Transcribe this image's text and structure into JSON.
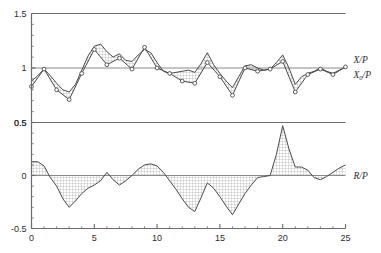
{
  "chart_data": {
    "type": "line",
    "title": "",
    "subtitle": "",
    "xlabel": "",
    "ylabel": "",
    "grid": false,
    "legend_position": "right",
    "panels": [
      {
        "name": "upper",
        "ylim": [
          0.5,
          1.5
        ],
        "yticks": [
          0.5,
          1.0,
          1.5
        ],
        "ytick_labels": [
          "0.5",
          "1",
          "1.5"
        ],
        "reference_line": 1.0,
        "xlim": [
          0,
          25
        ],
        "series": [
          {
            "name": "X/P",
            "marker": "none",
            "x": [
              0,
              0.5,
              1,
              1.5,
              2,
              2.5,
              3,
              3.5,
              4,
              4.5,
              5,
              5.5,
              6,
              6.5,
              7,
              7.5,
              8,
              8.5,
              9,
              9.5,
              10,
              10.5,
              11,
              11.5,
              12,
              12.5,
              13,
              13.5,
              14,
              14.5,
              15,
              15.5,
              16,
              16.5,
              17,
              17.5,
              18,
              18.5,
              19,
              19.5,
              20,
              20.5,
              21,
              21.5,
              22,
              22.5,
              23,
              23.5,
              24,
              24.5,
              25
            ],
            "values": [
              0.88,
              0.93,
              0.99,
              0.93,
              0.86,
              0.8,
              0.78,
              0.85,
              0.98,
              1.11,
              1.2,
              1.22,
              1.15,
              1.1,
              1.13,
              1.07,
              1.06,
              1.12,
              1.17,
              1.14,
              1.05,
              0.97,
              0.95,
              0.96,
              0.97,
              0.98,
              0.96,
              1.04,
              1.14,
              1.03,
              0.95,
              0.88,
              0.82,
              0.92,
              1.02,
              1.03,
              1.0,
              0.98,
              0.99,
              1.05,
              1.12,
              1.0,
              0.85,
              0.92,
              0.95,
              0.97,
              1.0,
              0.97,
              0.95,
              0.98,
              1.01
            ]
          },
          {
            "name": "X0/P",
            "marker": "circle",
            "x": [
              0,
              1,
              2,
              3,
              4,
              5,
              6,
              7,
              8,
              9,
              10,
              11,
              12,
              13,
              14,
              15,
              16,
              17,
              18,
              19,
              20,
              21,
              22,
              23,
              24,
              25
            ],
            "values": [
              0.83,
              0.99,
              0.8,
              0.71,
              0.95,
              1.17,
              1.03,
              1.09,
              0.99,
              1.19,
              1.0,
              0.95,
              0.88,
              0.86,
              1.05,
              0.92,
              0.75,
              1.0,
              0.97,
              0.99,
              1.06,
              0.78,
              0.94,
              0.99,
              0.94,
              1.01
            ]
          }
        ],
        "legend": [
          {
            "label": "X/P",
            "sub": ""
          },
          {
            "label": "X",
            "sub": "0",
            "suffix": "/P"
          }
        ]
      },
      {
        "name": "lower",
        "ylim": [
          -0.5,
          0.5
        ],
        "yticks": [
          -0.5,
          0.0,
          0.5
        ],
        "ytick_labels": [
          "-0.5",
          "0",
          "0.5"
        ],
        "reference_line": 0.0,
        "xlim": [
          0,
          25
        ],
        "series": [
          {
            "name": "R/P",
            "marker": "none",
            "fill": "crosshatch",
            "x": [
              0,
              0.5,
              1,
              1.5,
              2,
              2.5,
              3,
              3.5,
              4,
              4.5,
              5,
              5.5,
              6,
              6.5,
              7,
              7.5,
              8,
              8.5,
              9,
              9.5,
              10,
              10.5,
              11,
              11.5,
              12,
              12.5,
              13,
              13.5,
              14,
              14.5,
              15,
              15.5,
              16,
              16.5,
              17,
              17.5,
              18,
              18.5,
              19,
              19.5,
              20,
              20.5,
              21,
              21.5,
              22,
              22.5,
              23,
              23.5,
              24,
              24.5,
              25
            ],
            "values": [
              0.13,
              0.13,
              0.09,
              -0.02,
              -0.1,
              -0.22,
              -0.3,
              -0.24,
              -0.17,
              -0.12,
              -0.09,
              -0.05,
              0.03,
              -0.04,
              -0.09,
              -0.05,
              0.0,
              0.06,
              0.1,
              0.11,
              0.09,
              0.03,
              -0.05,
              -0.13,
              -0.22,
              -0.3,
              -0.34,
              -0.21,
              -0.07,
              -0.12,
              -0.2,
              -0.29,
              -0.37,
              -0.27,
              -0.17,
              -0.09,
              -0.02,
              -0.01,
              0.0,
              0.2,
              0.47,
              0.25,
              0.08,
              0.08,
              0.05,
              -0.02,
              -0.04,
              -0.01,
              0.03,
              0.07,
              0.1
            ]
          }
        ],
        "legend": [
          {
            "label": "R/P",
            "sub": ""
          }
        ]
      }
    ],
    "xticks": [
      0,
      5,
      10,
      15,
      20,
      25
    ],
    "xtick_labels": [
      "0",
      "5",
      "10",
      "15",
      "20",
      "25"
    ],
    "xminor_step": 1,
    "colors": {
      "line": "#4a4a4a",
      "axis": "#6b6b6b",
      "reference": "#8a8a8a",
      "hatch": "#8c8c8c",
      "text": "#2b2b2b",
      "background": "#ffffff"
    }
  },
  "axes": {
    "upper": {
      "ytick_labels": [
        "1.5",
        "1",
        "0.5"
      ]
    },
    "lower": {
      "ytick_labels": [
        "0.5",
        "0",
        "-0.5"
      ]
    },
    "xtick_labels": [
      "0",
      "5",
      "10",
      "15",
      "20",
      "25"
    ]
  },
  "legend": {
    "upper_1": "X/P",
    "upper_2_base": "X",
    "upper_2_sub": "0",
    "upper_2_tail": "/P",
    "lower_1": "R/P"
  }
}
